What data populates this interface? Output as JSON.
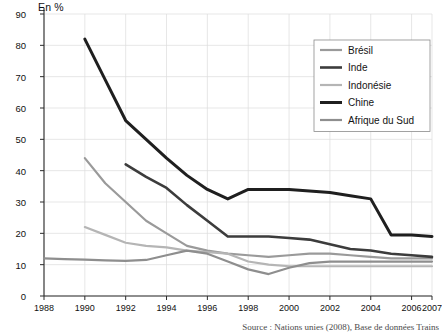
{
  "chart_data": {
    "type": "line",
    "title": "",
    "subtitle": "",
    "xlabel": "",
    "ylabel": "En %",
    "unit_label": "En %",
    "xlim": [
      1988,
      2007
    ],
    "ylim": [
      0,
      90
    ],
    "grid": true,
    "legend_position": "top-right",
    "x_ticks": [
      "1988",
      "1990",
      "1992",
      "1994",
      "1996",
      "1998",
      "2000",
      "2002",
      "2004",
      "2006",
      "2007"
    ],
    "y_ticks": [
      "0",
      "10",
      "20",
      "30",
      "40",
      "50",
      "60",
      "70",
      "80",
      "90"
    ],
    "source": "Source : Nations unies (2008), Base de données Trains",
    "series": [
      {
        "name": "Brésil",
        "color": "#9a9a9a",
        "x": [
          1990,
          1991,
          1992,
          1993,
          1994,
          1995,
          1996,
          1997,
          1998,
          1999,
          2000,
          2001,
          2002,
          2003,
          2004,
          2005,
          2006,
          2007
        ],
        "values": [
          44,
          36,
          30,
          24,
          20,
          16,
          14.5,
          13.5,
          13,
          12.5,
          13,
          13.5,
          13.5,
          13,
          12.5,
          12,
          12,
          12
        ]
      },
      {
        "name": "Inde",
        "color": "#3c3c3c",
        "x": [
          1992,
          1993,
          1994,
          1995,
          1996,
          1997,
          1998,
          1999,
          2000,
          2001,
          2002,
          2003,
          2004,
          2005,
          2006,
          2007
        ],
        "values": [
          42,
          38,
          34.5,
          29,
          24,
          19,
          19,
          19,
          18.5,
          18,
          16.5,
          15,
          14.5,
          13.5,
          13,
          12.5
        ]
      },
      {
        "name": "Indonésie",
        "color": "#b5b5b5",
        "x": [
          1990,
          1991,
          1992,
          1993,
          1994,
          1995,
          1996,
          1997,
          1998,
          1999,
          2000,
          2001,
          2002,
          2003,
          2004,
          2005,
          2006,
          2007
        ],
        "values": [
          22,
          19.5,
          17,
          16,
          15.5,
          14.5,
          14,
          13.5,
          11,
          10,
          9.5,
          9.5,
          9.5,
          9.5,
          9.5,
          9.5,
          9.5,
          9.5
        ]
      },
      {
        "name": "Chine",
        "color": "#1f1f1f",
        "x": [
          1990,
          1991,
          1992,
          1993,
          1994,
          1995,
          1996,
          1997,
          1998,
          1999,
          2000,
          2001,
          2002,
          2003,
          2004,
          2005,
          2006,
          2007
        ],
        "values": [
          82,
          69,
          56,
          50,
          44,
          38.5,
          34,
          31,
          34,
          34,
          34,
          33.5,
          33,
          32,
          31,
          19.5,
          19.5,
          19
        ]
      },
      {
        "name": "Afrique du Sud",
        "color": "#8e8e8e",
        "x": [
          1988,
          1989,
          1990,
          1991,
          1992,
          1993,
          1994,
          1995,
          1996,
          1997,
          1998,
          1999,
          2000,
          2001,
          2002,
          2003,
          2004,
          2005,
          2006,
          2007
        ],
        "values": [
          12,
          11.8,
          11.6,
          11.4,
          11.2,
          11.5,
          13,
          14.5,
          13.5,
          11,
          8.5,
          7,
          9,
          10.5,
          11,
          11,
          11,
          11,
          11,
          11
        ]
      }
    ]
  },
  "legend": {
    "items": [
      {
        "label": "Brésil",
        "color": "#9a9a9a",
        "width": 2.2
      },
      {
        "label": "Inde",
        "color": "#3c3c3c",
        "width": 2.6
      },
      {
        "label": "Indonésie",
        "color": "#b5b5b5",
        "width": 2.2
      },
      {
        "label": "Chine",
        "color": "#1f1f1f",
        "width": 3.0
      },
      {
        "label": "Afrique du Sud",
        "color": "#8e8e8e",
        "width": 2.2
      }
    ]
  },
  "footer": {
    "source": "Source : Nations unies (2008), Base de données Trains"
  },
  "colors": {
    "grid": "#dcdcdc",
    "axis": "#2b2b2b",
    "text": "#111111",
    "legend_border": "#8c8c8c",
    "background": "#ffffff"
  }
}
